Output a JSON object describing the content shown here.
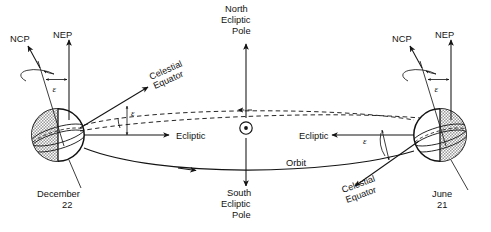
{
  "figure": {
    "type": "astronomy-diagram",
    "width": 491,
    "height": 232,
    "background_color": "#ffffff",
    "line_color": "#141414",
    "shade_color": "#b9b9b9"
  },
  "center": {
    "north_pole_label": "North\nEcliptic\nPole",
    "north_pole_line1": "North",
    "north_pole_line2": "Ecliptic",
    "north_pole_line3": "Pole",
    "south_pole_line1": "South",
    "south_pole_line2": "Ecliptic",
    "south_pole_line3": "Pole",
    "sun_symbol": "sun-symbol",
    "orbit_label": "Orbit"
  },
  "left_earth": {
    "date_line1": "December",
    "date_line2": "22",
    "ncp_label": "NCP",
    "nep_label": "NEP",
    "epsilon_axis": "ε",
    "epsilon_plane": "ε",
    "celestial_equator_line1": "Celestial",
    "celestial_equator_line2": "Equator",
    "ecliptic_label": "Ecliptic",
    "shaded_side": "left",
    "center_x": 58,
    "center_y": 135,
    "radius": 27
  },
  "right_earth": {
    "date_line1": "June",
    "date_line2": "21",
    "ncp_label": "NCP",
    "nep_label": "NEP",
    "epsilon_axis": "ε",
    "epsilon_plane": "ε",
    "celestial_equator_line1": "Celestial",
    "celestial_equator_line2": "Equator",
    "ecliptic_label": "Ecliptic",
    "shaded_side": "right",
    "center_x": 440,
    "center_y": 135,
    "radius": 27
  }
}
